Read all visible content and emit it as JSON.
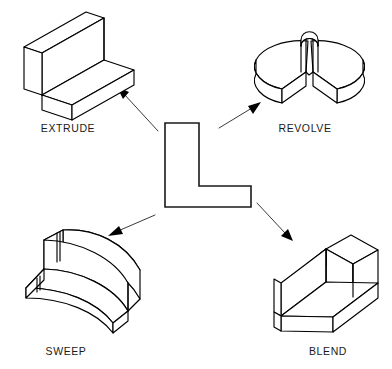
{
  "diagram": {
    "background_color": "#ffffff",
    "line_color": "#000000",
    "center_profile": {
      "name": "L-shaped profile",
      "type": "2d-outline"
    },
    "operations": [
      {
        "id": "extrude",
        "label": "EXTRUDE",
        "position": "top-left",
        "description": "L-shaped profile extruded linearly"
      },
      {
        "id": "revolve",
        "label": "REVOLVE",
        "position": "top-right",
        "description": "L-shaped profile revolved about an axis"
      },
      {
        "id": "sweep",
        "label": "SWEEP",
        "position": "bottom-left",
        "description": "L-shaped profile swept along a curved path"
      },
      {
        "id": "blend",
        "label": "BLEND",
        "position": "bottom-right",
        "description": "L-shaped profile blended between sections"
      }
    ],
    "arrows": [
      {
        "id": "arrow-to-extrude",
        "from": "center-profile",
        "to": "extrude"
      },
      {
        "id": "arrow-to-revolve",
        "from": "center-profile",
        "to": "revolve"
      },
      {
        "id": "arrow-to-sweep",
        "from": "center-profile",
        "to": "sweep"
      },
      {
        "id": "arrow-to-blend",
        "from": "center-profile",
        "to": "blend"
      }
    ]
  }
}
